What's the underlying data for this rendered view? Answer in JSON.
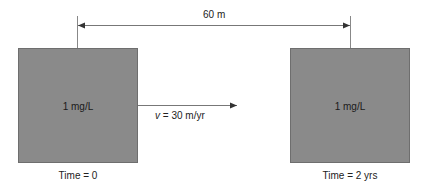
{
  "diagram": {
    "distance_label": "60 m",
    "velocity_label_var": "v",
    "velocity_label_rest": " = 30 m/yr",
    "left_block": {
      "concentration": "1 mg/L",
      "time": "Time = 0"
    },
    "right_block": {
      "concentration": "1 mg/L",
      "time": "Time = 2 yrs"
    },
    "colors": {
      "block_fill": "#8a8a8a",
      "line": "#555555"
    }
  }
}
